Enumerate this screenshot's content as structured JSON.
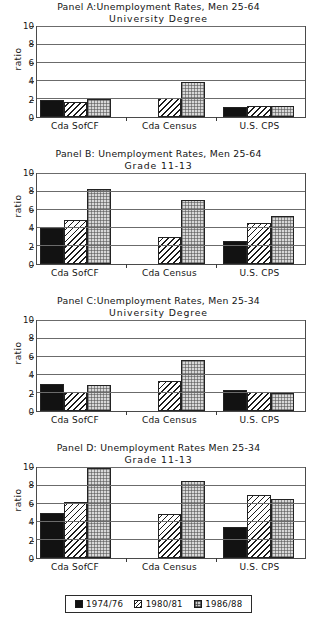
{
  "figure": {
    "ylabel": "ratio",
    "yticks": [
      "0",
      "2",
      "4",
      "6",
      "8",
      "10"
    ],
    "categories": [
      "Cda SofCF",
      "Cda Census",
      "U.S. CPS"
    ],
    "series_names": [
      "1974/76",
      "1980/81",
      "1986/88"
    ]
  },
  "legend": {
    "items": [
      {
        "label": "1974/76",
        "swatch": "solid-black-swatch"
      },
      {
        "label": "1980/81",
        "swatch": "diagonal-hatch-swatch"
      },
      {
        "label": "1986/88",
        "swatch": "dotted-grey-swatch"
      }
    ]
  },
  "chart_data": [
    {
      "type": "bar",
      "panel": "A",
      "title": "Panel A:Unemployment Rates, Men  25-64",
      "subtitle": "University  Degree",
      "xlabel": "",
      "ylabel": "ratio",
      "ylim": [
        0,
        10
      ],
      "yticks": [
        0,
        2,
        4,
        6,
        8,
        10
      ],
      "grid": true,
      "legend_position": "figure-bottom",
      "categories": [
        "Cda SofCF",
        "Cda Census",
        "U.S. CPS"
      ],
      "series": [
        {
          "name": "1974/76",
          "values": [
            1.9,
            null,
            1.15
          ]
        },
        {
          "name": "1980/81",
          "values": [
            1.65,
            2.1,
            1.25
          ]
        },
        {
          "name": "1986/88",
          "values": [
            2.05,
            3.9,
            1.2
          ]
        }
      ]
    },
    {
      "type": "bar",
      "panel": "B",
      "title": "Panel B: Unemployment Rates, Men  25-64",
      "subtitle": "Grade 11-13",
      "xlabel": "",
      "ylabel": "ratio",
      "ylim": [
        0,
        10
      ],
      "yticks": [
        0,
        2,
        4,
        6,
        8,
        10
      ],
      "grid": true,
      "legend_position": "figure-bottom",
      "categories": [
        "Cda SofCF",
        "Cda Census",
        "U.S. CPS"
      ],
      "series": [
        {
          "name": "1974/76",
          "values": [
            4.0,
            null,
            2.6
          ]
        },
        {
          "name": "1980/81",
          "values": [
            4.85,
            2.95,
            4.55
          ]
        },
        {
          "name": "1986/88",
          "values": [
            8.35,
            7.15,
            5.3
          ]
        }
      ]
    },
    {
      "type": "bar",
      "panel": "C",
      "title": "Panel C:Unemployment Rates, Men 25-34",
      "subtitle": "University  Degree",
      "xlabel": "",
      "ylabel": "ratio",
      "ylim": [
        0,
        10
      ],
      "yticks": [
        0,
        2,
        4,
        6,
        8,
        10
      ],
      "grid": true,
      "legend_position": "figure-bottom",
      "categories": [
        "Cda SofCF",
        "Cda Census",
        "U.S. CPS"
      ],
      "series": [
        {
          "name": "1974/76",
          "values": [
            2.95,
            null,
            2.35
          ]
        },
        {
          "name": "1980/81",
          "values": [
            2.1,
            3.3,
            2.15
          ]
        },
        {
          "name": "1986/88",
          "values": [
            2.9,
            5.65,
            2.0
          ]
        }
      ]
    },
    {
      "type": "bar",
      "panel": "D",
      "title": "Panel D: Unemployment Rates  Men 25-34",
      "subtitle": "Grade 11-13",
      "xlabel": "",
      "ylabel": "ratio",
      "ylim": [
        0,
        10
      ],
      "yticks": [
        0,
        2,
        4,
        6,
        8,
        10
      ],
      "grid": true,
      "legend_position": "figure-bottom",
      "categories": [
        "Cda SofCF",
        "Cda Census",
        "U.S. CPS"
      ],
      "series": [
        {
          "name": "1974/76",
          "values": [
            5.0,
            null,
            3.5
          ]
        },
        {
          "name": "1980/81",
          "values": [
            6.2,
            4.9,
            7.0
          ]
        },
        {
          "name": "1986/88",
          "values": [
            10.0,
            8.6,
            6.6
          ]
        }
      ]
    }
  ]
}
